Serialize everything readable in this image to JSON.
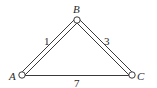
{
  "diagram": {
    "type": "weighted-graph",
    "nodes": [
      {
        "id": "A",
        "label": "A",
        "x": 22,
        "y": 75
      },
      {
        "id": "B",
        "label": "B",
        "x": 77,
        "y": 20
      },
      {
        "id": "C",
        "label": "C",
        "x": 132,
        "y": 75
      }
    ],
    "edges": [
      {
        "from": "A",
        "to": "B",
        "weight": "1",
        "style": "double"
      },
      {
        "from": "B",
        "to": "C",
        "weight": "3",
        "style": "double"
      },
      {
        "from": "A",
        "to": "C",
        "weight": "7",
        "style": "single"
      }
    ]
  }
}
